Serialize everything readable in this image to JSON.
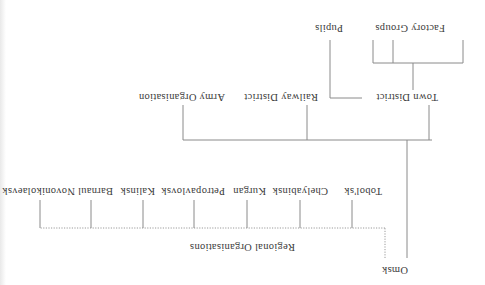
{
  "diagram": {
    "orientation": "rotated-180",
    "root": {
      "label": "Omsk",
      "children": [
        {
          "label": "Town District",
          "children": [
            {
              "label": "Factory Groups",
              "branch_count": 3
            },
            {
              "label": "Pupils"
            }
          ]
        },
        {
          "label": "Railway District"
        },
        {
          "label": "Army Organisation"
        }
      ]
    },
    "regional": {
      "label": "Regional Organisations",
      "link_style": "dotted",
      "items": [
        "Tobol'sk",
        "Chelyabinsk",
        "Kurgan",
        "Petropavlovsk",
        "Kalinsk",
        "Barnaul",
        "Novonikolaevsk"
      ]
    }
  }
}
